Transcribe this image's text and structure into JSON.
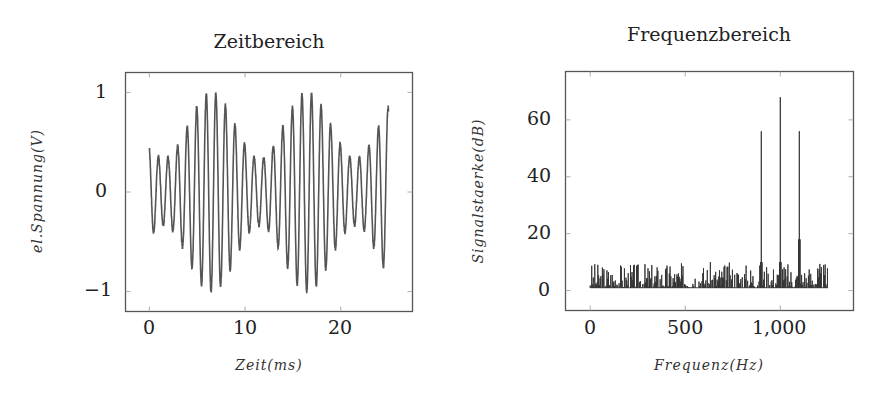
{
  "chart_data": [
    {
      "type": "line",
      "title": "Zeitbereich",
      "xlabel": "Zeit(ms)",
      "ylabel": "el.Spannung(V)",
      "xlim": [
        -2.5,
        27.5
      ],
      "ylim": [
        -1.2,
        1.2
      ],
      "xticks": [
        0,
        10,
        20
      ],
      "xtick_labels": [
        "0",
        "10",
        "20"
      ],
      "yticks": [
        -1,
        0,
        1
      ],
      "ytick_labels": [
        "−1",
        "0",
        "1"
      ],
      "grid": false,
      "series": [
        {
          "name": "AM-Signal",
          "description": "1 kHz carrier, amplitude-modulated at 100 Hz; envelope ~0.33–1.0, max near 6.5 ms and 16.5 ms",
          "x_start_ms": 0,
          "x_end_ms": 25,
          "carrier_hz": 1000,
          "modulation_hz": 100,
          "carrier_amplitude": 0.667,
          "modulation_amplitude": 0.333,
          "envelope_peak_ms": [
            6.5,
            16.5
          ],
          "min_value": -1.0,
          "max_value": 1.0
        }
      ]
    },
    {
      "type": "bar",
      "title": "Frequenzbereich",
      "xlabel": "Frequenz(Hz)",
      "ylabel": "Signalstaerke(dB)",
      "xlim": [
        -130,
        1385
      ],
      "ylim": [
        -7,
        77
      ],
      "xticks": [
        0,
        500,
        1000
      ],
      "xtick_labels": [
        "0",
        "500",
        "1,000"
      ],
      "yticks": [
        0,
        20,
        40,
        60
      ],
      "ytick_labels": [
        "0",
        "20",
        "40",
        "60"
      ],
      "grid": false,
      "series": [
        {
          "name": "Spektrum",
          "peaks": [
            {
              "x": 900,
              "y": 56
            },
            {
              "x": 1000,
              "y": 68
            },
            {
              "x": 1100,
              "y": 56
            }
          ],
          "noise_floor_db": 1,
          "noise_max_db": 10,
          "x_range_hz": [
            0,
            1250
          ]
        }
      ]
    }
  ]
}
